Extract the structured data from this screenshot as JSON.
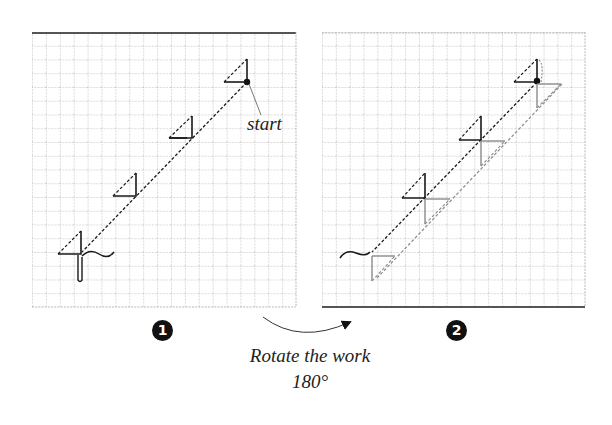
{
  "figure": {
    "panels": [
      {
        "step": "1",
        "grid": {
          "x": 32,
          "y": 32,
          "width": 264,
          "height": 275,
          "cols": 19,
          "rows": 20
        },
        "annotation": "start"
      },
      {
        "step": "2",
        "grid": {
          "x": 322,
          "y": 32,
          "width": 263,
          "height": 275,
          "cols": 19,
          "rows": 20
        }
      }
    ],
    "caption": {
      "line1": "Rotate the work",
      "line2": "180°"
    },
    "colors": {
      "grid_line": "#9a9a9a",
      "grid_border": "#555555",
      "stitch_dark": "#1a1a1a",
      "stitch_light": "#8a8a8a",
      "badge_bg": "#111111",
      "badge_fg": "#ffffff",
      "text": "#222222"
    }
  }
}
